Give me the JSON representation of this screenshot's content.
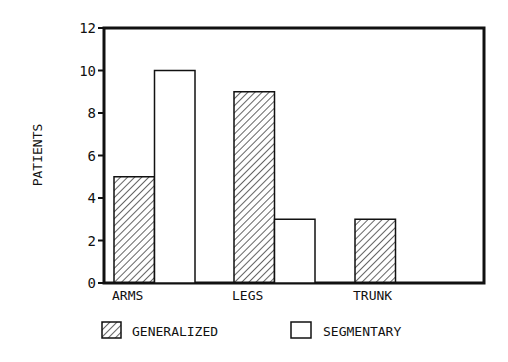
{
  "chart_data": {
    "type": "bar",
    "title": "",
    "xlabel": "",
    "ylabel": "PATIENTS",
    "ylim": [
      0,
      12
    ],
    "yticks": [
      0,
      2,
      4,
      6,
      8,
      10,
      12
    ],
    "categories": [
      "ARMS",
      "LEGS",
      "TRUNK"
    ],
    "series": [
      {
        "name": "GENERALIZED",
        "pattern": "hatched",
        "values": [
          5,
          9,
          3
        ]
      },
      {
        "name": "SEGMENTARY",
        "pattern": "open",
        "values": [
          10,
          3,
          0
        ]
      }
    ],
    "grid": false,
    "legend_position": "bottom"
  },
  "colors": {
    "ink": "#111111",
    "background": "#ffffff"
  }
}
